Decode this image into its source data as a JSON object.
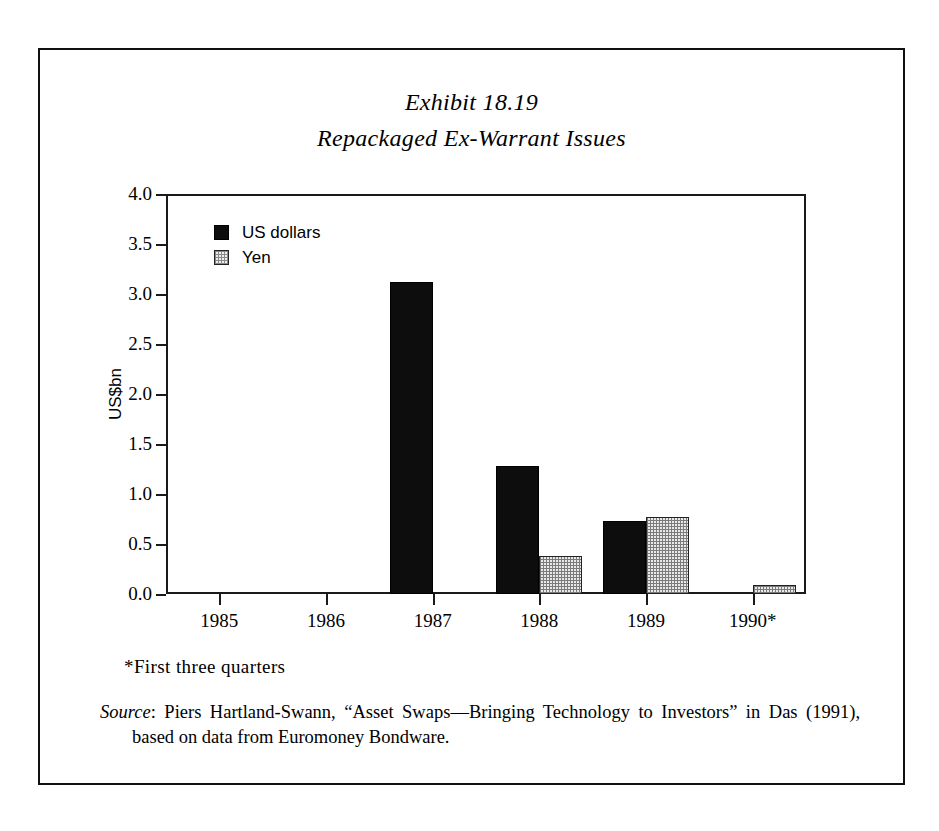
{
  "figure": {
    "title_line1": "Exhibit 18.19",
    "title_line2": "Repackaged Ex-Warrant Issues",
    "footnote": "*First three quarters",
    "source_label": "Source",
    "source_separator": ": ",
    "source_text": "Piers Hartland-Swann, “Asset Swaps—Bringing Technology to Investors” in Das (1991), based on data from Euromoney Bondware."
  },
  "chart_data": {
    "type": "bar",
    "title": "Repackaged Ex-Warrant Issues",
    "subtitle": "Exhibit 18.19",
    "categories": [
      "1985",
      "1986",
      "1987",
      "1988",
      "1989",
      "1990*"
    ],
    "series": [
      {
        "name": "US dollars",
        "color": "#0d0d0d",
        "values": [
          0.0,
          0.0,
          3.12,
          1.28,
          0.73,
          0.0
        ]
      },
      {
        "name": "Yen",
        "color": "#e9e9e9",
        "values": [
          0.0,
          0.0,
          0.0,
          0.38,
          0.77,
          0.09
        ]
      }
    ],
    "xlabel": "",
    "ylabel": "US$bn",
    "ylim": [
      0.0,
      4.0
    ],
    "yticks": [
      "0.0",
      "0.5",
      "1.0",
      "1.5",
      "2.0",
      "2.5",
      "3.0",
      "3.5",
      "4.0"
    ],
    "ytick_values": [
      0.0,
      0.5,
      1.0,
      1.5,
      2.0,
      2.5,
      3.0,
      3.5,
      4.0
    ],
    "grid": false,
    "legend_position": "top-left",
    "annotations": [
      "*First three quarters"
    ]
  }
}
